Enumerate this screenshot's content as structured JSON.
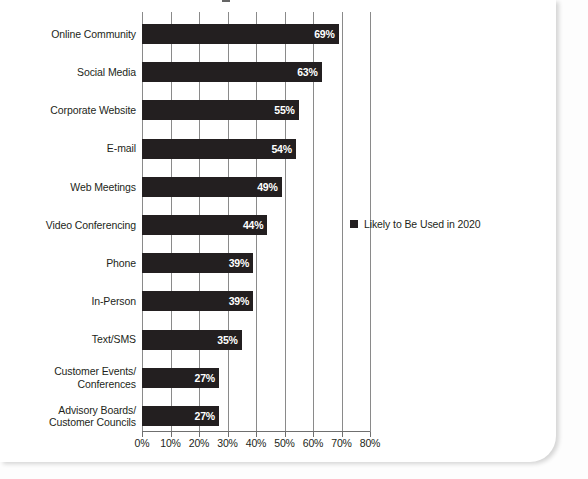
{
  "chart_data": {
    "type": "bar",
    "orientation": "horizontal",
    "title": "",
    "xlabel": "",
    "ylabel": "",
    "xlim": [
      0,
      80
    ],
    "xtick_labels": [
      "0%",
      "10%",
      "20%",
      "30%",
      "40%",
      "50%",
      "60%",
      "70%",
      "80%"
    ],
    "xticks": [
      0,
      10,
      20,
      30,
      40,
      50,
      60,
      70,
      80
    ],
    "grid": true,
    "grid_axis": "x",
    "legend_position": "right",
    "legend": [
      "Likely to Be Used in 2020"
    ],
    "series": [
      {
        "name": "Likely to Be Used in 2020",
        "color": "#231f20",
        "values": [
          69,
          63,
          55,
          54,
          49,
          44,
          39,
          39,
          35,
          27,
          27
        ]
      }
    ],
    "categories": [
      "Online Community",
      "Social Media",
      "Corporate Website",
      "E-mail",
      "Web Meetings",
      "Video Conferencing",
      "Phone",
      "In-Person",
      "Text/SMS",
      "Customer Events/\nConferences",
      "Advisory Boards/\nCustomer Councils"
    ],
    "data_labels": [
      "69%",
      "63%",
      "55%",
      "54%",
      "49%",
      "44%",
      "39%",
      "39%",
      "35%",
      "27%",
      "27%"
    ]
  },
  "legend": {
    "swatch_color": "#231f20",
    "label": "Likely to Be Used in 2020"
  },
  "colors": {
    "bar": "#231f20",
    "gridline": "#8a8a8a",
    "axis": "#6f6f6f",
    "text": "#231f20",
    "value_text": "#ffffff",
    "page": "#ffffff"
  }
}
